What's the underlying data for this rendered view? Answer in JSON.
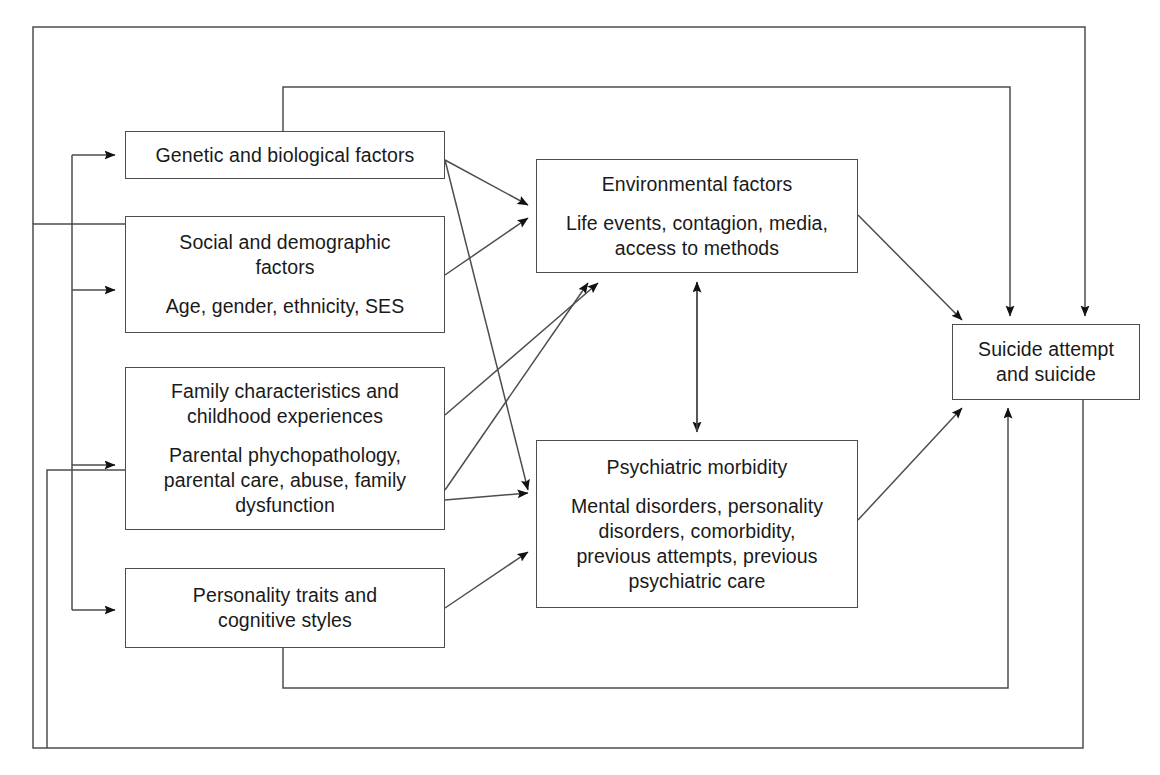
{
  "diagram": {
    "stroke_color": "#4d4d4d",
    "text_color": "#1a1a1a",
    "background": "#ffffff"
  },
  "nodes": [
    {
      "id": "genetic",
      "name": "genetic-and-biological-factors",
      "title": "Genetic and biological factors",
      "detail": "",
      "x": 125,
      "y": 131,
      "w": 320,
      "h": 48
    },
    {
      "id": "social",
      "name": "social-and-demographic-factors",
      "title": "Social and demographic\nfactors",
      "detail": "Age, gender, ethnicity, SES",
      "x": 125,
      "y": 216,
      "w": 320,
      "h": 117
    },
    {
      "id": "family",
      "name": "family-characteristics-and-childhood-experiences",
      "title": "Family characteristics and\nchildhood experiences",
      "detail": "Parental phychopathology,\nparental care, abuse, family\ndysfunction",
      "x": 125,
      "y": 367,
      "w": 320,
      "h": 163
    },
    {
      "id": "personality",
      "name": "personality-traits-and-cognitive-styles",
      "title": "Personality traits and\ncognitive styles",
      "detail": "",
      "x": 125,
      "y": 568,
      "w": 320,
      "h": 80
    },
    {
      "id": "environmental",
      "name": "environmental-factors",
      "title": "Environmental factors",
      "detail": "Life events, contagion, media,\naccess to methods",
      "x": 536,
      "y": 159,
      "w": 322,
      "h": 114
    },
    {
      "id": "psychiatric",
      "name": "psychiatric-morbidity",
      "title": "Psychiatric morbidity",
      "detail": "Mental disorders, personality\ndisorders, comorbidity,\nprevious attempts, previous\npsychiatric care",
      "x": 536,
      "y": 440,
      "w": 322,
      "h": 168
    },
    {
      "id": "outcome",
      "name": "suicide-attempt-and-suicide",
      "title": "Suicide attempt\nand suicide",
      "detail": "",
      "x": 952,
      "y": 324,
      "w": 188,
      "h": 76
    }
  ],
  "edges": [
    {
      "name": "edge-genetic-to-environmental",
      "from": "genetic",
      "to": "environmental",
      "kind": "diagonal"
    },
    {
      "name": "edge-genetic-to-psychiatric",
      "from": "genetic",
      "to": "psychiatric",
      "kind": "diagonal"
    },
    {
      "name": "edge-social-to-environmental",
      "from": "social",
      "to": "environmental",
      "kind": "diagonal"
    },
    {
      "name": "edge-family-to-environmental",
      "from": "family",
      "to": "environmental",
      "kind": "diagonal"
    },
    {
      "name": "edge-family-to-psychiatric",
      "from": "family",
      "to": "psychiatric",
      "kind": "diagonal"
    },
    {
      "name": "edge-personality-to-psychiatric",
      "from": "personality",
      "to": "psychiatric",
      "kind": "diagonal"
    },
    {
      "name": "edge-environmental-to-psychiatric-bidirectional",
      "from": "environmental",
      "to": "psychiatric",
      "kind": "bidirectional-vertical"
    },
    {
      "name": "edge-environmental-to-outcome",
      "from": "environmental",
      "to": "outcome",
      "kind": "diagonal"
    },
    {
      "name": "edge-psychiatric-to-outcome",
      "from": "psychiatric",
      "to": "outcome",
      "kind": "diagonal"
    },
    {
      "name": "feedback-outcome-to-genetic",
      "from": "outcome",
      "to": "genetic",
      "kind": "orthogonal-loop"
    },
    {
      "name": "feedback-outcome-to-social",
      "from": "outcome",
      "to": "social",
      "kind": "orthogonal-loop"
    },
    {
      "name": "feedback-outcome-to-family",
      "from": "outcome",
      "to": "family",
      "kind": "orthogonal-loop"
    },
    {
      "name": "feedback-outcome-to-personality",
      "from": "outcome",
      "to": "personality",
      "kind": "orthogonal-loop"
    }
  ]
}
